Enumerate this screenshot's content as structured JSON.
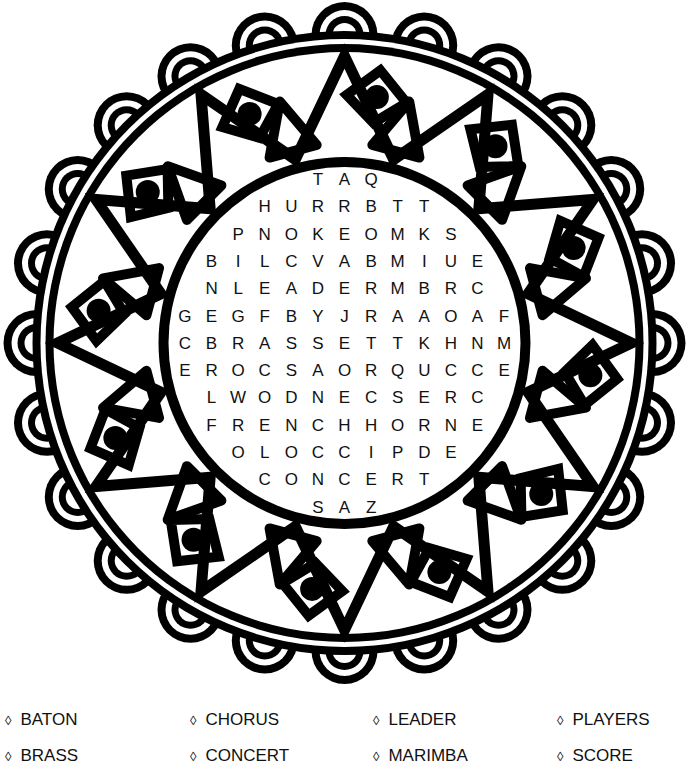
{
  "puzzle": {
    "type": "word-search",
    "theme_color": "#000000",
    "background_color": "#ffffff",
    "grid_rows": [
      "TAQ",
      "HURRBTT",
      "PNOKEOMKS",
      "BILCVABMIUE",
      "NLEADERMBRC",
      "GEGFBYJRAAOAF",
      "CBRASSETTKHNM",
      "EROCSAORQUCCE",
      "LWODNECSERC",
      "FRENCHHORNE",
      "OLOCCIPDE",
      "CONCERT",
      "SAZ"
    ]
  },
  "word_list": {
    "bullet_icon": "◊",
    "columns": [
      [
        "BATON",
        "BRASS"
      ],
      [
        "CHORUS",
        "CONCERT"
      ],
      [
        "LEADER",
        "MARIMBA"
      ],
      [
        "PLAYERS",
        "SCORE"
      ]
    ]
  }
}
